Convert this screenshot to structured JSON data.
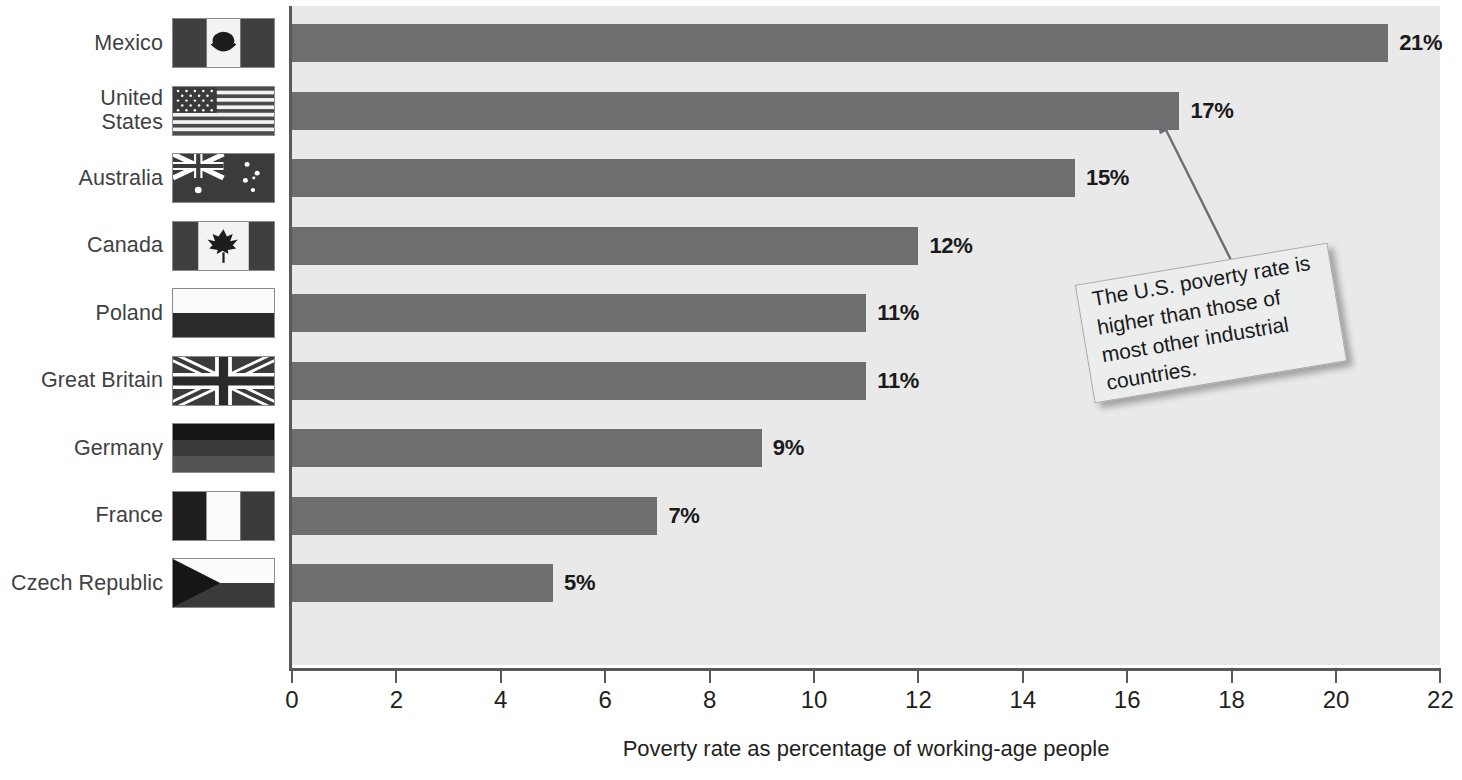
{
  "chart_data": {
    "type": "bar",
    "orientation": "horizontal",
    "title": "",
    "xlabel": "Poverty rate as percentage of working-age people",
    "ylabel": "",
    "xlim": [
      0,
      22
    ],
    "xticks": [
      0,
      2,
      4,
      6,
      8,
      10,
      12,
      14,
      16,
      18,
      20,
      22
    ],
    "grid": false,
    "legend": null,
    "bar_color": "#6e6e6e",
    "plot_background": "#e9e9e9",
    "categories": [
      "Mexico",
      "United States",
      "Australia",
      "Canada",
      "Poland",
      "Great Britain",
      "Germany",
      "France",
      "Czech Republic"
    ],
    "values": [
      21,
      17,
      15,
      12,
      11,
      11,
      9,
      7,
      5
    ],
    "value_labels": [
      "21%",
      "17%",
      "15%",
      "12%",
      "11%",
      "11%",
      "9%",
      "7%",
      "5%"
    ],
    "annotations": [
      {
        "text": "The U.S. poverty rate is higher than those of most other industrial countries.",
        "points_to": "United States"
      }
    ]
  },
  "rows": [
    {
      "label": "Mexico",
      "label_lines": [
        "Mexico"
      ],
      "value": 21,
      "value_label": "21%",
      "flag": "flag-mexico"
    },
    {
      "label": "United States",
      "label_lines": [
        "United",
        "States"
      ],
      "value": 17,
      "value_label": "17%",
      "flag": "flag-united-states"
    },
    {
      "label": "Australia",
      "label_lines": [
        "Australia"
      ],
      "value": 15,
      "value_label": "15%",
      "flag": "flag-australia"
    },
    {
      "label": "Canada",
      "label_lines": [
        "Canada"
      ],
      "value": 12,
      "value_label": "12%",
      "flag": "flag-canada"
    },
    {
      "label": "Poland",
      "label_lines": [
        "Poland"
      ],
      "value": 11,
      "value_label": "11%",
      "flag": "flag-poland"
    },
    {
      "label": "Great Britain",
      "label_lines": [
        "Great Britain"
      ],
      "value": 11,
      "value_label": "11%",
      "flag": "flag-great-britain"
    },
    {
      "label": "Germany",
      "label_lines": [
        "Germany"
      ],
      "value": 9,
      "value_label": "9%",
      "flag": "flag-germany"
    },
    {
      "label": "France",
      "label_lines": [
        "France"
      ],
      "value": 7,
      "value_label": "7%",
      "flag": "flag-france"
    },
    {
      "label": "Czech Republic",
      "label_lines": [
        "Czech Republic"
      ],
      "value": 5,
      "value_label": "5%",
      "flag": "flag-czech-republic"
    }
  ],
  "axis": {
    "title": "Poverty rate as percentage of working-age people",
    "tick_labels": [
      "0",
      "2",
      "4",
      "6",
      "8",
      "10",
      "12",
      "14",
      "16",
      "18",
      "20",
      "22"
    ]
  },
  "callout": {
    "text": "The U.S. poverty rate is higher than those of most other industrial countries."
  }
}
